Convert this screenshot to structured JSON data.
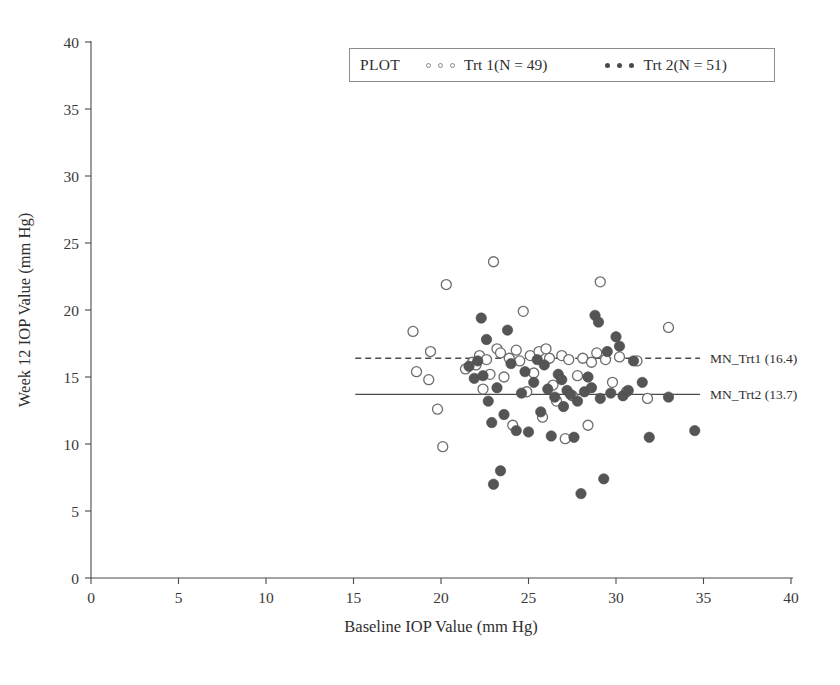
{
  "chart_data": {
    "type": "scatter",
    "title": "",
    "xlabel": "Baseline IOP Value (mm Hg)",
    "ylabel": "Week 12 IOP Value (mm Hg)",
    "xlim": [
      0,
      40
    ],
    "ylim": [
      0,
      40
    ],
    "xticks": [
      0,
      5,
      10,
      15,
      20,
      25,
      30,
      35,
      40
    ],
    "yticks": [
      0,
      5,
      10,
      15,
      20,
      25,
      30,
      35,
      40
    ],
    "grid": false,
    "legend_position": "top-right",
    "legend_title": "PLOT",
    "series": [
      {
        "name": "Trt 1(N = 49)",
        "marker": "open-circle",
        "color": "#ffffff",
        "edge_color": "#6d6d6d",
        "n": 49,
        "points": [
          [
            18.4,
            18.4
          ],
          [
            18.6,
            15.4
          ],
          [
            19.3,
            14.8
          ],
          [
            19.4,
            16.9
          ],
          [
            19.8,
            12.6
          ],
          [
            20.1,
            9.8
          ],
          [
            20.3,
            21.9
          ],
          [
            21.4,
            15.6
          ],
          [
            21.8,
            16.1
          ],
          [
            22.0,
            15.9
          ],
          [
            22.2,
            16.6
          ],
          [
            22.4,
            14.1
          ],
          [
            22.6,
            16.3
          ],
          [
            22.8,
            15.2
          ],
          [
            23.0,
            23.6
          ],
          [
            23.2,
            17.1
          ],
          [
            23.4,
            16.8
          ],
          [
            23.6,
            15.0
          ],
          [
            23.9,
            16.4
          ],
          [
            24.1,
            11.4
          ],
          [
            24.3,
            17.0
          ],
          [
            24.5,
            16.2
          ],
          [
            24.7,
            19.9
          ],
          [
            24.9,
            13.9
          ],
          [
            25.1,
            16.6
          ],
          [
            25.3,
            15.3
          ],
          [
            25.6,
            16.9
          ],
          [
            25.8,
            12.0
          ],
          [
            26.0,
            17.1
          ],
          [
            26.2,
            16.4
          ],
          [
            26.4,
            14.4
          ],
          [
            26.6,
            13.2
          ],
          [
            26.9,
            16.6
          ],
          [
            27.1,
            10.4
          ],
          [
            27.3,
            16.3
          ],
          [
            27.5,
            13.6
          ],
          [
            27.8,
            15.1
          ],
          [
            28.1,
            16.4
          ],
          [
            28.4,
            11.4
          ],
          [
            28.6,
            16.1
          ],
          [
            28.9,
            16.8
          ],
          [
            29.1,
            22.1
          ],
          [
            29.4,
            16.3
          ],
          [
            29.8,
            14.6
          ],
          [
            30.2,
            16.5
          ],
          [
            30.6,
            13.9
          ],
          [
            31.2,
            16.2
          ],
          [
            31.8,
            13.4
          ],
          [
            33.0,
            18.7
          ]
        ]
      },
      {
        "name": "Trt 2(N = 51)",
        "marker": "filled-circle",
        "color": "#555555",
        "edge_color": "#4a4a4a",
        "n": 51,
        "points": [
          [
            21.6,
            15.8
          ],
          [
            21.9,
            14.9
          ],
          [
            22.1,
            16.2
          ],
          [
            22.3,
            19.4
          ],
          [
            22.4,
            15.1
          ],
          [
            22.6,
            17.8
          ],
          [
            22.7,
            13.2
          ],
          [
            22.9,
            11.6
          ],
          [
            23.0,
            7.0
          ],
          [
            23.2,
            14.2
          ],
          [
            23.4,
            8.0
          ],
          [
            23.6,
            12.2
          ],
          [
            23.8,
            18.5
          ],
          [
            24.0,
            16.0
          ],
          [
            24.3,
            11.0
          ],
          [
            24.6,
            13.8
          ],
          [
            24.8,
            15.4
          ],
          [
            25.0,
            10.9
          ],
          [
            25.3,
            14.6
          ],
          [
            25.5,
            16.3
          ],
          [
            25.7,
            12.4
          ],
          [
            25.9,
            15.9
          ],
          [
            26.1,
            14.1
          ],
          [
            26.3,
            10.6
          ],
          [
            26.5,
            13.5
          ],
          [
            26.7,
            15.2
          ],
          [
            26.9,
            14.8
          ],
          [
            27.0,
            12.8
          ],
          [
            27.2,
            14.0
          ],
          [
            27.4,
            13.7
          ],
          [
            27.6,
            10.5
          ],
          [
            27.8,
            13.2
          ],
          [
            28.0,
            6.3
          ],
          [
            28.2,
            13.9
          ],
          [
            28.4,
            15.0
          ],
          [
            28.6,
            14.2
          ],
          [
            28.8,
            19.6
          ],
          [
            29.0,
            19.1
          ],
          [
            29.1,
            13.4
          ],
          [
            29.3,
            7.4
          ],
          [
            29.5,
            16.9
          ],
          [
            29.7,
            13.8
          ],
          [
            30.0,
            18.0
          ],
          [
            30.2,
            17.3
          ],
          [
            30.4,
            13.6
          ],
          [
            30.7,
            14.0
          ],
          [
            31.0,
            16.2
          ],
          [
            31.5,
            14.6
          ],
          [
            31.9,
            10.5
          ],
          [
            33.0,
            13.5
          ],
          [
            34.5,
            11.0
          ]
        ]
      }
    ],
    "reference_lines": [
      {
        "id": "mn-trt1",
        "label": "MN_Trt1 (16.4)",
        "value": 16.4,
        "style": "dashed",
        "x_start": 15.1,
        "x_end": 34.8,
        "color": "#4a4a4a"
      },
      {
        "id": "mn-trt2",
        "label": "MN_Trt2 (13.7)",
        "value": 13.7,
        "style": "solid",
        "x_start": 15.1,
        "x_end": 34.8,
        "color": "#4a4a4a"
      }
    ]
  },
  "legend": {
    "title": "PLOT",
    "entries": [
      {
        "label": "Trt 1(N = 49)",
        "marker": "open-circle"
      },
      {
        "label": "Trt 2(N = 51)",
        "marker": "filled-circle"
      }
    ]
  }
}
